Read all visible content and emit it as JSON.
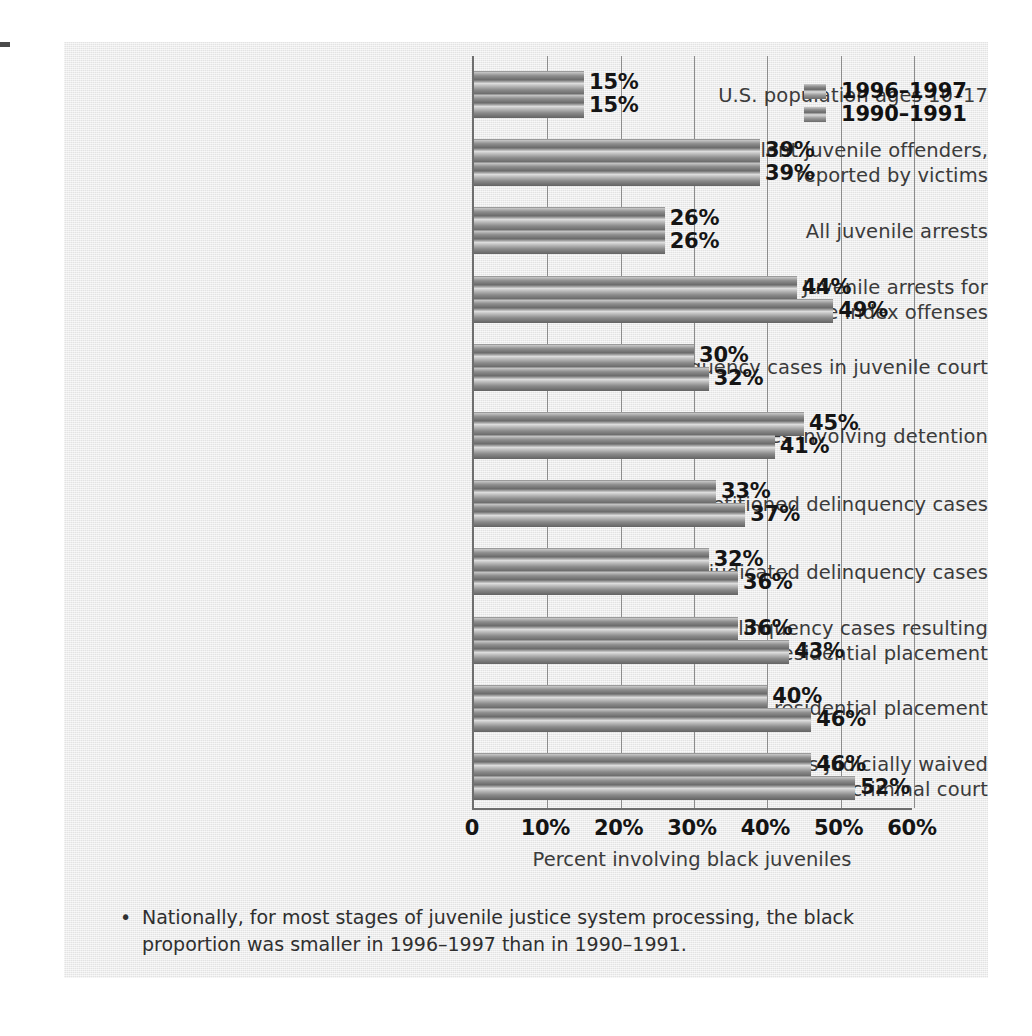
{
  "chart_data": {
    "type": "bar",
    "orientation": "horizontal",
    "title": "",
    "xlabel": "Percent involving black juveniles",
    "ylabel": "",
    "xlim": [
      0,
      60
    ],
    "xticks": [
      0,
      10,
      20,
      30,
      40,
      50,
      60
    ],
    "xtick_labels": [
      "0",
      "10%",
      "20%",
      "30%",
      "40%",
      "50%",
      "60%"
    ],
    "grid": "vertical",
    "legend_position": "top-right",
    "categories": [
      "U.S. population ages 10–17",
      "Violent juvenile offenders,\nreported by victims",
      "All juvenile arrests",
      "Juvenile arrests for\nviolent crime index offenses",
      "Delinquency cases in juvenile court",
      "Delinquency cases involving detention",
      "Petitioned delinquency cases",
      "Adjudicated delinquency cases",
      "Delinquency cases resulting\nin residential placement",
      "Juveniles in residential placement",
      "Cases judicially waived\nto criminal court"
    ],
    "series": [
      {
        "name": "1996–1997",
        "values": [
          15,
          39,
          26,
          44,
          30,
          45,
          33,
          32,
          36,
          40,
          46
        ],
        "value_labels": [
          "15%",
          "39%",
          "26%",
          "44%",
          "30%",
          "45%",
          "33%",
          "32%",
          "36%",
          "40%",
          "46%"
        ]
      },
      {
        "name": "1990–1991",
        "values": [
          15,
          39,
          26,
          49,
          32,
          41,
          37,
          36,
          43,
          46,
          52
        ],
        "value_labels": [
          "15%",
          "39%",
          "26%",
          "49%",
          "32%",
          "41%",
          "37%",
          "36%",
          "43%",
          "46%",
          "52%"
        ]
      }
    ]
  },
  "legend": {
    "items": [
      {
        "label": "1996–1997",
        "swatch": "gradient-gray-bar"
      },
      {
        "label": "1990–1991",
        "swatch": "gradient-gray-bar"
      }
    ]
  },
  "axis": {
    "title": "Percent involving black juveniles",
    "tick_labels": [
      "0",
      "10%",
      "20%",
      "30%",
      "40%",
      "50%",
      "60%"
    ]
  },
  "caption": {
    "bullet": "•",
    "text": "Nationally, for most stages of juvenile justice system processing, the black proportion was smaller in 1996–1997 than in 1990–1991."
  },
  "colors": {
    "panel_background": "#e7e7e7",
    "bar_dark": "#636363",
    "bar_light": "#dcdcdc",
    "axis_line": "#6e6e6e",
    "gridline": "#8c8c8c",
    "label_text": "#3b3b3b",
    "value_text": "#151515"
  }
}
